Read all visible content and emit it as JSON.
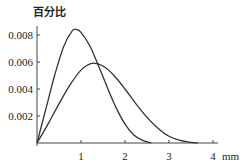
{
  "chart_data": {
    "type": "line",
    "title": "",
    "xlabel": "mm",
    "ylabel": "百分比",
    "xlim": [
      0,
      4
    ],
    "ylim": [
      0,
      0.008
    ],
    "x_ticks": [
      "1",
      "2",
      "3",
      "4"
    ],
    "y_ticks": [
      "0.002",
      "0.004",
      "0.006",
      "0.008"
    ],
    "grid": false,
    "legend": null,
    "series": [
      {
        "name": "narrow-distribution",
        "x": [
          0,
          0.2,
          0.4,
          0.6,
          0.8,
          0.9,
          1.0,
          1.2,
          1.4,
          1.6,
          1.8,
          2.0,
          2.2,
          2.4,
          2.6
        ],
        "values": [
          0,
          0.0025,
          0.005,
          0.0071,
          0.0083,
          0.0084,
          0.0082,
          0.0072,
          0.0057,
          0.0041,
          0.0026,
          0.0014,
          0.0006,
          0.0002,
          0
        ]
      },
      {
        "name": "wide-distribution",
        "x": [
          0,
          0.25,
          0.5,
          0.75,
          1.0,
          1.25,
          1.5,
          1.75,
          2.0,
          2.25,
          2.5,
          2.75,
          3.0,
          3.25,
          3.5,
          3.65
        ],
        "values": [
          0,
          0.0014,
          0.0029,
          0.0043,
          0.0054,
          0.0059,
          0.0057,
          0.005,
          0.004,
          0.0029,
          0.0019,
          0.0011,
          0.0005,
          0.0002,
          5e-05,
          0
        ]
      }
    ]
  }
}
